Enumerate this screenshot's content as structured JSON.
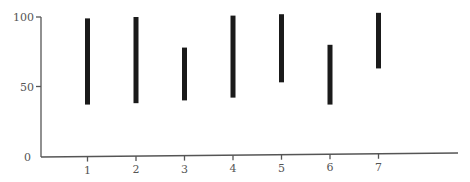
{
  "chart_data": {
    "type": "range-bar",
    "title": "",
    "xlabel": "",
    "ylabel": "",
    "categories": [
      "1",
      "2",
      "3",
      "4",
      "5",
      "6",
      "7"
    ],
    "series": [
      {
        "name": "range",
        "low": [
          37,
          38,
          40,
          42,
          53,
          37,
          63
        ],
        "high": [
          99,
          100,
          78,
          101,
          102,
          80,
          103
        ]
      }
    ],
    "yticks": [
      0,
      50,
      100
    ],
    "ytick_labels": [
      "0",
      "50",
      "100"
    ],
    "ylim": [
      0,
      105
    ],
    "grid": false,
    "legend": null,
    "colors": {
      "bar": "#1a1a1a",
      "axis": "#555555",
      "text": "#555555"
    }
  }
}
